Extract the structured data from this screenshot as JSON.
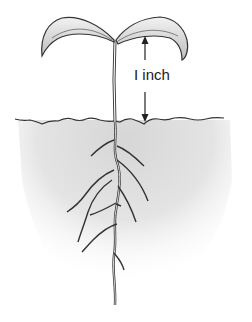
{
  "diagram": {
    "measurement_label": "I inch",
    "colors": {
      "background": "#ffffff",
      "soil_shade": "#dcdcdc",
      "line": "#333333",
      "leaf_fill": "#e6e6e6"
    }
  }
}
